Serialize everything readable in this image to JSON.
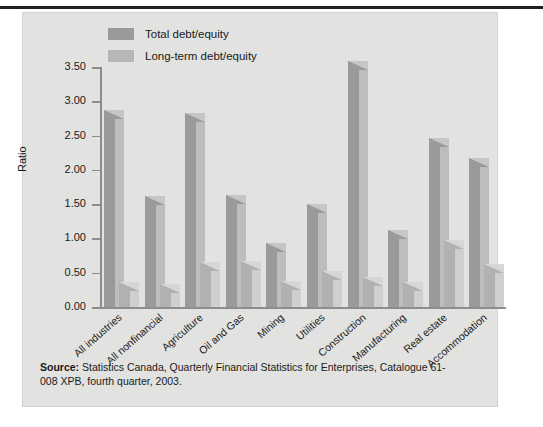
{
  "figure": {
    "background": "#e2e2e0",
    "rule_color": "#231f20"
  },
  "legend": {
    "position": "top-center",
    "items": [
      {
        "label": "Total debt/equity",
        "color": "#9a9a9a",
        "swatch": "legend-swatch-total"
      },
      {
        "label": "Long-term debt/equity",
        "color": "#b6b6b4",
        "swatch": "legend-swatch-longterm"
      }
    ]
  },
  "axes": {
    "ylabel": "Ratio",
    "yticks": [
      "0.00",
      "0.50",
      "1.00",
      "1.50",
      "2.00",
      "2.50",
      "3.00",
      "3.50"
    ]
  },
  "source": {
    "prefix": "Source:",
    "text": " Statistics Canada, Quarterly Financial Statistics for Enterprises, Catalogue 61-008 XPB, fourth quarter, 2003."
  },
  "chart_data": {
    "type": "bar",
    "title": "",
    "subtitle": "",
    "xlabel": "",
    "ylabel": "Ratio",
    "ylim": [
      0,
      3.5
    ],
    "yticks": [
      0,
      0.5,
      1.0,
      1.5,
      2.0,
      2.5,
      3.0,
      3.5
    ],
    "grid": false,
    "legend_position": "top-center",
    "categories": [
      "All industries",
      "All nonfinancial",
      "Agriculture",
      "Oil and Gas",
      "Mining",
      "Utilities",
      "Construction",
      "Manufacturing",
      "Real estate",
      "Accommodation"
    ],
    "series": [
      {
        "name": "Total debt/equity",
        "color": "#9a9a9a",
        "values": [
          2.74,
          1.49,
          2.7,
          1.5,
          0.8,
          1.37,
          3.45,
          0.99,
          2.33,
          2.04
        ]
      },
      {
        "name": "Long-term debt/equity",
        "color": "#b1b1af",
        "values": [
          0.23,
          0.21,
          0.52,
          0.54,
          0.25,
          0.39,
          0.3,
          0.23,
          0.85,
          0.49
        ]
      }
    ],
    "annotations": [
      "Source: Statistics Canada, Quarterly Financial Statistics for Enterprises, Catalogue 61-008 XPB, fourth quarter, 2003."
    ]
  }
}
